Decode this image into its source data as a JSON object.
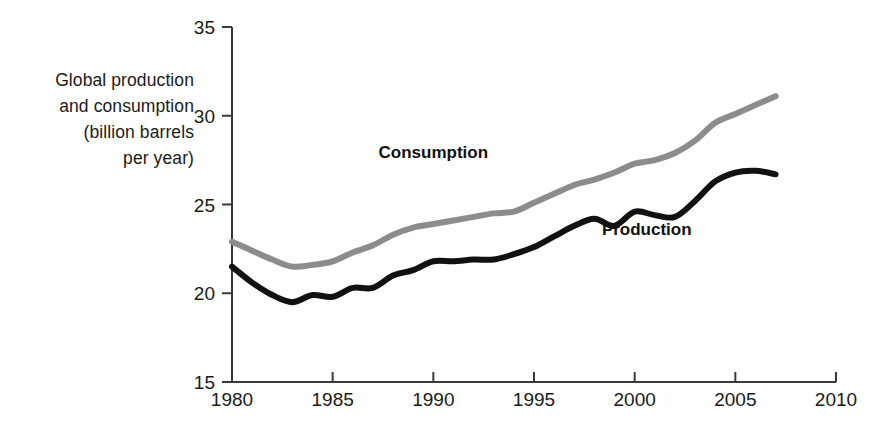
{
  "chart_data": {
    "type": "line",
    "title": "",
    "xlabel": "",
    "ylabel": "Global production and consumption (billion barrels per year)",
    "ylabel_lines": [
      "Global production",
      "and consumption",
      "(billion barrels",
      "per year)"
    ],
    "xlim": [
      1980,
      2010
    ],
    "ylim": [
      15,
      35
    ],
    "grid": false,
    "legend_position": "inline-annotations",
    "xticks": [
      1980,
      1985,
      1990,
      1995,
      2000,
      2005,
      2010
    ],
    "xtick_labels": [
      "1980",
      "1985",
      "1990",
      "1995",
      "2000",
      "2005",
      "2010"
    ],
    "yticks": [
      15,
      20,
      25,
      30,
      35
    ],
    "ytick_labels": [
      "15",
      "20",
      "25",
      "30",
      "35"
    ],
    "x": [
      1980,
      1981,
      1982,
      1983,
      1984,
      1985,
      1986,
      1987,
      1988,
      1989,
      1990,
      1991,
      1992,
      1993,
      1994,
      1995,
      1996,
      1997,
      1998,
      1999,
      2000,
      2001,
      2002,
      2003,
      2004,
      2005,
      2006,
      2007
    ],
    "series": [
      {
        "name": "Consumption",
        "color": "#8c8c8c",
        "label_x": 1990,
        "label_y": 27.6,
        "values": [
          22.9,
          22.4,
          21.9,
          21.5,
          21.6,
          21.8,
          22.3,
          22.7,
          23.3,
          23.7,
          23.9,
          24.1,
          24.3,
          24.5,
          24.6,
          25.1,
          25.6,
          26.1,
          26.4,
          26.8,
          27.3,
          27.5,
          27.9,
          28.6,
          29.6,
          30.1,
          30.6,
          31.1
        ]
      },
      {
        "name": "Production",
        "color": "#111111",
        "label_x": 2000.6,
        "label_y": 23.3,
        "values": [
          21.5,
          20.6,
          19.9,
          19.5,
          19.9,
          19.8,
          20.3,
          20.3,
          21.0,
          21.3,
          21.8,
          21.8,
          21.9,
          21.9,
          22.2,
          22.6,
          23.2,
          23.8,
          24.2,
          23.8,
          24.6,
          24.4,
          24.3,
          25.2,
          26.3,
          26.8,
          26.9,
          26.7
        ]
      }
    ]
  },
  "axis": {
    "y_label": "Global production and consumption (billion barrels per year)"
  }
}
